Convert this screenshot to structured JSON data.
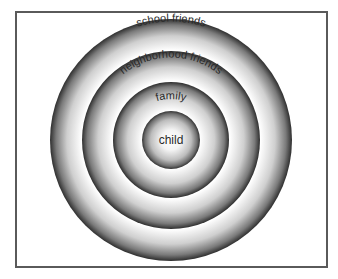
{
  "diagram": {
    "type": "concentric-circles",
    "center": {
      "x": 171,
      "y": 140
    },
    "rings": [
      {
        "label": "school friends",
        "radius": 121
      },
      {
        "label": "neighborhood friends",
        "radius": 89
      },
      {
        "label": "family",
        "radius": 58
      },
      {
        "label": "child",
        "radius": 29
      }
    ],
    "colors": {
      "ring_dark": "#3a3a3a",
      "ring_light": "#ffffff",
      "text": "#2a2a2a",
      "frame": "#5a5a5a"
    }
  }
}
